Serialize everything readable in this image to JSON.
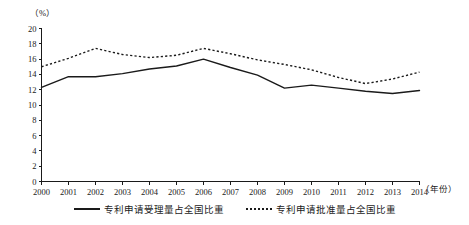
{
  "chart_data": {
    "type": "line",
    "title": "",
    "xlabel": "（年份）",
    "ylabel": "（%）",
    "ylim": [
      0,
      20
    ],
    "ytick_step": 2,
    "grid": false,
    "legend_position": "bottom",
    "categories": [
      "2000",
      "2001",
      "2002",
      "2003",
      "2004",
      "2005",
      "2006",
      "2007",
      "2008",
      "2009",
      "2010",
      "2011",
      "2012",
      "2013",
      "2014"
    ],
    "yticks": [
      "0",
      "2",
      "4",
      "6",
      "8",
      "10",
      "12",
      "14",
      "16",
      "18",
      "20"
    ],
    "series": [
      {
        "name": "专利申请受理量占全国比重",
        "style": "solid",
        "color": "#1a1a1a",
        "values": [
          12.3,
          13.7,
          13.7,
          14.1,
          14.7,
          15.1,
          16.0,
          14.9,
          13.9,
          12.2,
          12.6,
          12.2,
          11.8,
          11.5,
          11.9
        ]
      },
      {
        "name": "专利申请批准量占全国比重",
        "style": "dotted",
        "color": "#1a1a1a",
        "values": [
          15.0,
          16.1,
          17.4,
          16.6,
          16.2,
          16.5,
          17.4,
          16.7,
          15.9,
          15.3,
          14.6,
          13.6,
          12.8,
          13.4,
          14.3
        ]
      }
    ]
  },
  "axis": {
    "y_unit_label": "（%）",
    "x_unit_label": "（年份）"
  },
  "legend": {
    "items": [
      {
        "label": "专利申请受理量占全国比重",
        "style": "solid"
      },
      {
        "label": "专利申请批准量占全国比重",
        "style": "dotted"
      }
    ]
  }
}
